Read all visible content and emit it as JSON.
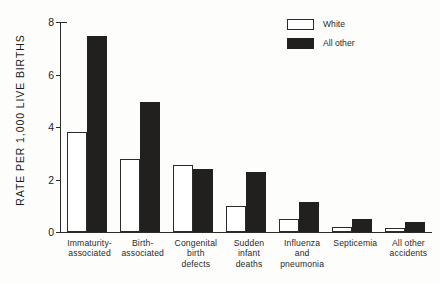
{
  "chart_data": {
    "type": "bar",
    "title": "",
    "subtitle": "",
    "xlabel": "",
    "ylabel": "RATE PER 1,000 LIVE BIRTHS",
    "ylim": [
      0,
      8
    ],
    "yticks": [
      "0",
      "2",
      "4",
      "6",
      "8"
    ],
    "ytick_values": [
      0,
      2,
      4,
      6,
      8
    ],
    "grid": false,
    "legend_position": "top-right",
    "categories": [
      "Immaturity-\nassociated",
      "Birth-\nassociated",
      "Congenital\nbirth\ndefects",
      "Sudden\ninfant\ndeaths",
      "Influenza\nand\npneumonia",
      "Septicemia",
      "All other\naccidents"
    ],
    "category_lines": [
      [
        "Immaturity-",
        "associated"
      ],
      [
        "Birth-",
        "associated"
      ],
      [
        "Congenital",
        "birth",
        "defects"
      ],
      [
        "Sudden",
        "infant",
        "deaths"
      ],
      [
        "Influenza",
        "and",
        "pneumonia"
      ],
      [
        "Septicemia"
      ],
      [
        "All other",
        "accidents"
      ]
    ],
    "series": [
      {
        "name": "White",
        "color": "#ffffff",
        "edge_color": "#2b2b2b",
        "values": [
          3.8,
          2.8,
          2.55,
          1.0,
          0.5,
          0.2,
          0.15
        ]
      },
      {
        "name": "All other",
        "color": "#221f1f",
        "edge_color": "#221f1f",
        "values": [
          7.45,
          4.95,
          2.4,
          2.3,
          1.15,
          0.5,
          0.4
        ]
      }
    ]
  },
  "legend": {
    "items": [
      {
        "label": "White",
        "swatch": "white"
      },
      {
        "label": "All other",
        "swatch": "black"
      }
    ]
  },
  "colors": {
    "background": "#fdfdfb",
    "axis": "#2b2b2b",
    "text": "#1b1b1b",
    "bar_white": "#ffffff",
    "bar_black": "#221f1f"
  }
}
